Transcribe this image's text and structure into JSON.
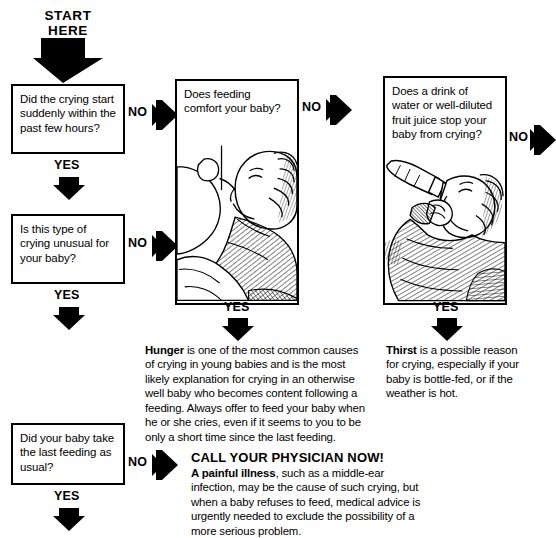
{
  "chart": {
    "start_label": "START\nHERE",
    "start_line1": "START",
    "start_line2": "HERE",
    "yes_label": "YES",
    "no_label": "NO"
  },
  "left_column": {
    "q1": "Did the crying start suddenly within the past few hours?",
    "q1_no": "NO",
    "q1_yes": "YES",
    "q2": "Is this type of crying unusual for your baby?",
    "q2_no": "NO",
    "q2_yes": "YES",
    "q3": "Did your baby take the last feeding as usual?",
    "q3_no": "NO",
    "q3_yes": "YES"
  },
  "middle_column": {
    "question": "Does feeding comfort your baby?",
    "no": "NO",
    "yes": "YES",
    "illustration": "baby-breastfeeding-illustration",
    "answer_heading": "Hunger",
    "answer_body": " is one of the most common causes of crying in young babies and is the most likely explanation for crying in an otherwise well baby who becomes content following a feeding. Always offer to feed your baby when he or she cries, even if it seems to you to be only a short time since the last feeding."
  },
  "right_column": {
    "question": "Does a drink of water or well-diluted fruit juice stop your baby from crying?",
    "no": "NO",
    "yes": "YES",
    "illustration": "baby-drinking-bottle-illustration",
    "answer_heading": "Thirst",
    "answer_body": " is a possible reason for crying, especially if your baby is bottle-fed, or if the weather is hot."
  },
  "call_section": {
    "title": "CALL YOUR PHYSICIAN NOW!",
    "heading": "A painful illness",
    "body": ", such as a middle-ear infection, may be the cause of such crying, but when a baby refuses to feed, medical advice is urgently needed to exclude the possibility of a more serious problem."
  },
  "colors": {
    "ink": "#000000",
    "paper": "#ffffff"
  }
}
